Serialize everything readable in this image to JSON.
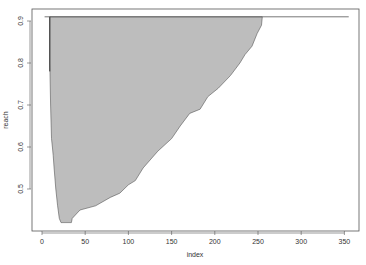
{
  "chart_data": {
    "type": "area",
    "title": "",
    "xlabel": "index",
    "ylabel": "reach",
    "xlim": [
      -8,
      368
    ],
    "ylim": [
      0.4,
      0.92
    ],
    "x_ticks": [
      0,
      50,
      100,
      150,
      200,
      250,
      300,
      350
    ],
    "y_ticks": [
      0.5,
      0.6,
      0.7,
      0.8,
      0.9
    ],
    "grid": false,
    "legend": null,
    "colors": {
      "fill": "#bdbdbd",
      "line": "#555555",
      "axis": "#555555",
      "background": "#ffffff"
    },
    "top_line": {
      "x_start": 3,
      "x_end": 355,
      "y": 0.91
    },
    "polygon": {
      "left_edge": [
        [
          9,
          0.91
        ],
        [
          9,
          0.8
        ],
        [
          10,
          0.7
        ],
        [
          11,
          0.62
        ],
        [
          12,
          0.6
        ],
        [
          13,
          0.58
        ],
        [
          14,
          0.55
        ],
        [
          16,
          0.5
        ],
        [
          18,
          0.46
        ],
        [
          20,
          0.43
        ],
        [
          22,
          0.42
        ]
      ],
      "right_edge": [
        [
          34,
          0.42
        ],
        [
          35,
          0.43
        ],
        [
          44,
          0.45
        ],
        [
          62,
          0.46
        ],
        [
          79,
          0.48
        ],
        [
          90,
          0.49
        ],
        [
          100,
          0.51
        ],
        [
          108,
          0.52
        ],
        [
          117,
          0.55
        ],
        [
          134,
          0.59
        ],
        [
          150,
          0.62
        ],
        [
          160,
          0.65
        ],
        [
          171,
          0.68
        ],
        [
          183,
          0.69
        ],
        [
          192,
          0.72
        ],
        [
          204,
          0.74
        ],
        [
          218,
          0.77
        ],
        [
          229,
          0.8
        ],
        [
          235,
          0.82
        ],
        [
          243,
          0.84
        ],
        [
          249,
          0.87
        ],
        [
          254,
          0.89
        ],
        [
          255,
          0.91
        ]
      ]
    }
  }
}
